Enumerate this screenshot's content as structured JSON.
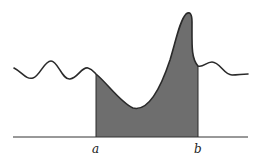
{
  "diagram": {
    "type": "definite-integral-area",
    "labels": {
      "lower_bound": "a",
      "upper_bound": "b"
    },
    "colors": {
      "curve": "#2a2a2a",
      "fill": "#6e6e6e",
      "axis": "#333333",
      "background": "#ffffff"
    }
  }
}
